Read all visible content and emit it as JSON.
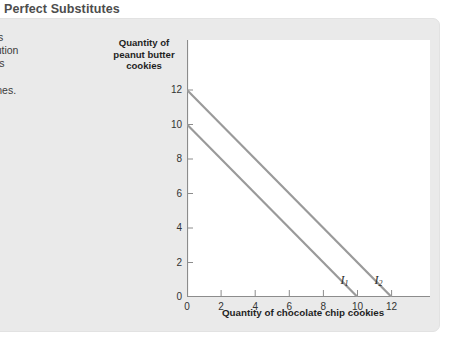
{
  "figure": {
    "title": "Perfect Substitutes",
    "caption_lines": [
      "ct substitutes",
      "te of substitution",
      "the quantities",
      "se, the",
      "re straight lines."
    ]
  },
  "colors": {
    "panel_background": "#eaeaea",
    "plot_background": "#ffffff",
    "axis": "#8c8c8c",
    "line": "#9a9a9a",
    "title_text": "#4d4d4d",
    "label_text": "#1f1f1f"
  },
  "chart_data": {
    "type": "line",
    "title": "Perfect Substitutes",
    "xlabel": "Quantity of chocolate chip cookies",
    "ylabel": "Quantity of peanut butter cookies",
    "xlim": [
      0,
      14
    ],
    "ylim": [
      0,
      13
    ],
    "xticks": [
      "0",
      "2",
      "4",
      "6",
      "8",
      "10",
      "12"
    ],
    "xtick_values": [
      0,
      2,
      4,
      6,
      8,
      10,
      12
    ],
    "yticks": [
      "0",
      "2",
      "4",
      "6",
      "8",
      "10",
      "12"
    ],
    "ytick_values": [
      0,
      2,
      4,
      6,
      8,
      10,
      12
    ],
    "grid": false,
    "legend": "none",
    "series": [
      {
        "name": "I1",
        "label": "I",
        "label_sub": "1",
        "points": [
          {
            "x": 0,
            "y": 10
          },
          {
            "x": 10,
            "y": 0
          }
        ],
        "label_x": 9.0,
        "label_y": 0.75
      },
      {
        "name": "I2",
        "label": "I",
        "label_sub": "2",
        "points": [
          {
            "x": 0,
            "y": 12
          },
          {
            "x": 12,
            "y": 0
          }
        ],
        "label_x": 11.0,
        "label_y": 0.75
      }
    ]
  }
}
